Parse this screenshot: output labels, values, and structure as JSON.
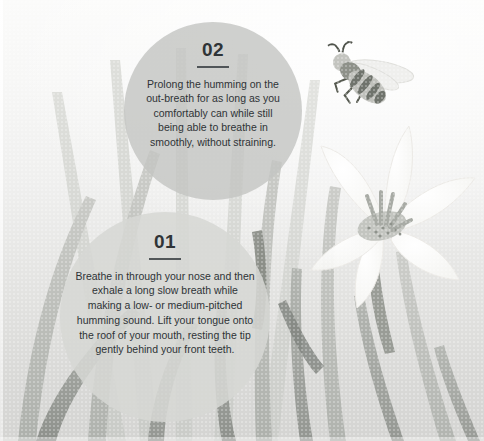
{
  "canvas": {
    "width": 484,
    "height": 441,
    "background_top": "#fbfbfa",
    "background_bottom": "#d4d4d2"
  },
  "palette": {
    "bubble_step2": "#c3c4c2",
    "bubble_step1": "#d6d7d4",
    "text": "#2e3336",
    "leaf_light": "#d2d3d0",
    "leaf_mid": "#bdbfbb",
    "leaf_dark": "#9a9d98",
    "leaf_darkest": "#7e827d",
    "flower_petal": "#fdfdfc",
    "flower_center": "#b9bbb6",
    "bee_body": "#b8b9b4",
    "bee_stripe": "#6f736e",
    "bee_wing": "#ebebe8"
  },
  "steps": [
    {
      "id": "01",
      "number": "01",
      "body": "Breathe in through your nose and then exhale a long slow breath while making a low- or medium-pitched humming sound. Lift your tongue onto the roof of your mouth, resting the tip gently behind your front teeth."
    },
    {
      "id": "02",
      "number": "02",
      "body": "Prolong the humming on the out-breath for as long as you comfortably can while still being able to breathe in smoothly, without straining."
    }
  ],
  "illustration": {
    "bee_label": "honeybee-illustration",
    "flower_label": "white-flower-illustration",
    "foliage_label": "grass-blade-foliage"
  }
}
